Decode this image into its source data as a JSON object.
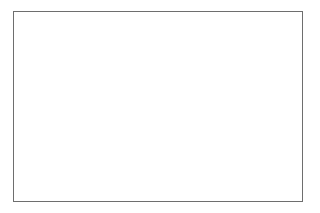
{
  "figure": {
    "title": "Response over Time by Drug",
    "background_color": "#ffffff",
    "frame_color": "#6e6e6e",
    "line_color": "#000000"
  },
  "chart_data": {
    "type": "line",
    "title": "Response over Time by Drug",
    "xlabel": "",
    "ylabel": "Efficacy",
    "xlim": [
      0,
      12
    ],
    "ylim": [
      0,
      20
    ],
    "yticks": [
      0,
      5,
      10,
      15,
      20
    ],
    "ytick_labels": [
      "0",
      "5",
      "10",
      "15",
      "20"
    ],
    "xticks": [
      0,
      2,
      4,
      6,
      8,
      10,
      12
    ],
    "xtick_labels": [
      "Jan",
      "Mar",
      "May",
      "Jul",
      "Sep",
      "Nov",
      "Jan"
    ],
    "xtick_sublabels": [
      "2009",
      "",
      "",
      "",
      "",
      "",
      "2010"
    ],
    "grid": false,
    "legend_position": "bottom",
    "x": [
      0,
      1,
      2,
      3,
      4,
      5,
      6,
      7,
      8,
      9,
      10,
      11,
      12
    ],
    "series": [
      {
        "name": "Drug A",
        "style": "solid",
        "color": "#000000",
        "values": [
          18.2,
          19.2,
          19.1,
          18.3,
          17.9,
          18.0,
          18.2,
          17.9,
          16.4,
          14.4,
          13.0,
          12.9,
          13.5
        ]
      },
      {
        "name": "Drug B",
        "style": "dotted",
        "color": "#000000",
        "values": [
          12.2,
          12.1,
          12.0,
          12.5,
          13.0,
          13.3,
          13.1,
          11.9,
          10.1,
          8.4,
          7.8,
          8.0,
          8.4
        ]
      },
      {
        "name": "Drug C",
        "style": "dashed",
        "color": "#000000",
        "values": [
          13.3,
          12.9,
          11.9,
          9.9,
          8.3,
          8.0,
          8.2,
          8.6,
          8.5,
          7.6,
          7.0,
          7.6,
          10.0
        ]
      }
    ]
  },
  "legend": {
    "items": [
      {
        "label": "Drug A",
        "style": "solid"
      },
      {
        "label": "Drug B",
        "style": "dotted"
      },
      {
        "label": "Drug C",
        "style": "dashed"
      }
    ]
  }
}
